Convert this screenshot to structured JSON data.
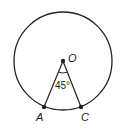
{
  "diagram": {
    "type": "circle-central-angle",
    "center": {
      "label": "O",
      "x": 63,
      "y": 61
    },
    "radius": 49,
    "points": [
      {
        "label": "A",
        "x": 44,
        "y": 107
      },
      {
        "label": "C",
        "x": 81,
        "y": 107
      }
    ],
    "angle": {
      "vertex": "O",
      "value_text": "45°",
      "degrees": 45
    },
    "colors": {
      "stroke": "#222222",
      "background": "#ffffff"
    }
  }
}
